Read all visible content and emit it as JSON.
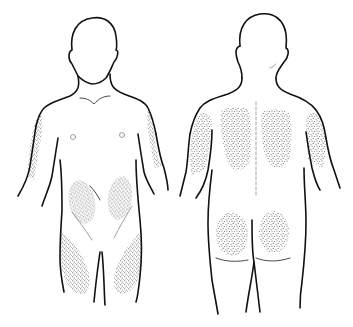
{
  "diagram": {
    "type": "anatomical-illustration",
    "colors": {
      "outline": "#111111",
      "stipple": "#555555",
      "background": "#ffffff"
    },
    "figures": [
      {
        "view": "front",
        "shaded_regions": [
          "left-upper-arm",
          "right-upper-arm",
          "left-abdomen",
          "right-abdomen",
          "left-thigh",
          "right-thigh"
        ]
      },
      {
        "view": "back",
        "shaded_regions": [
          "left-upper-arm",
          "right-upper-arm",
          "left-upper-back",
          "right-upper-back",
          "left-buttock",
          "right-buttock"
        ]
      }
    ]
  }
}
